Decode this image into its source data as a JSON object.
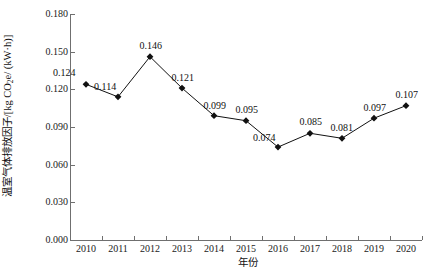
{
  "chart_data": {
    "type": "line",
    "title": "",
    "xlabel": "年份",
    "ylabel": "温室气体排放因子/[kg CO₂e/ (kW·h)]",
    "categories": [
      "2010",
      "2011",
      "2012",
      "2013",
      "2014",
      "2015",
      "2016",
      "2017",
      "2018",
      "2019",
      "2020"
    ],
    "values": [
      0.124,
      0.114,
      0.146,
      0.121,
      0.099,
      0.095,
      0.074,
      0.085,
      0.081,
      0.097,
      0.107
    ],
    "point_labels": [
      "0.124",
      "0.114",
      "0.146",
      "0.121",
      "0.099",
      "0.095",
      "0.074",
      "0.085",
      "0.081",
      "0.097",
      "0.107"
    ],
    "ylim": [
      0.0,
      0.18
    ],
    "yticks": [
      0.0,
      0.03,
      0.06,
      0.09,
      0.12,
      0.15,
      0.18
    ],
    "ytick_labels": [
      "0.000",
      "0.030",
      "0.060",
      "0.090",
      "0.120",
      "0.150",
      "0.180"
    ],
    "grid": false,
    "legend": false,
    "marker": "filled-diamond",
    "line_color": "#111111",
    "marker_color": "#111111",
    "background_color": "#ffffff",
    "axis_color": "#6f6f6f"
  },
  "axis_titles": {
    "y_prefix": "温室气体排放因子/[kg CO",
    "y_sub": "2",
    "y_suffix": "e/ (kW·h)]",
    "x": "年份"
  }
}
